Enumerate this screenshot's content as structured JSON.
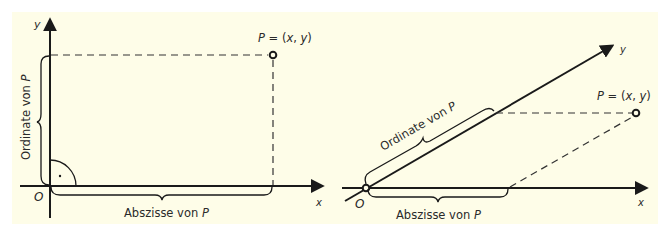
{
  "colors": {
    "background": "#fefde8",
    "ink": "#1a1a1a",
    "text": "#2a2a2a"
  },
  "left_diagram": {
    "title": "Rechtwinkliges Koordinatensystem",
    "axis_x_label": "x",
    "axis_y_label": "y",
    "origin_label": "O",
    "point_label": "P = (x, y)",
    "ordinate_label": "Ordinate von P",
    "abscissa_label": "Abszisse von P",
    "right_angle_mark": "·"
  },
  "right_diagram": {
    "title": "Schiefwinkliges Koordinatensystem",
    "axis_x_label": "x",
    "axis_y_label": "y",
    "origin_label": "O",
    "point_label": "P = (x, y)",
    "ordinate_label": "Ordinate von P",
    "abscissa_label": "Abszisse von P"
  }
}
